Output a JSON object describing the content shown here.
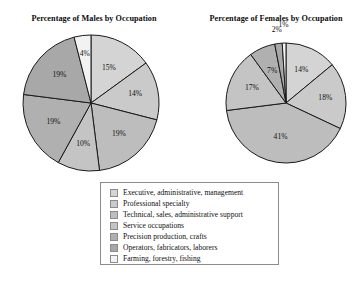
{
  "figure": {
    "background_color": "#ffffff",
    "outline_color": "#1a1a1a"
  },
  "charts": {
    "males": {
      "title": "Percentage of Males by Occupation"
    },
    "females": {
      "title": "Percentage of Females by Occupation"
    }
  },
  "legend": {
    "border_color": "#8c8c8c",
    "items": [
      {
        "label": "Executive, administrative, management",
        "color": "#d4d4d4"
      },
      {
        "label": "Professional specialty",
        "color": "#cacaca"
      },
      {
        "label": "Technical, sales, administrative support",
        "color": "#bdbdbd"
      },
      {
        "label": "Service occupations",
        "color": "#c4c4c4"
      },
      {
        "label": "Precision production, crafts",
        "color": "#b0b0b0"
      },
      {
        "label": "Operators, fabricators, laborers",
        "color": "#a8a8a8"
      },
      {
        "label": "Farming, forestry, fishing",
        "color": "#f2f2f2"
      }
    ]
  },
  "chart_data": [
    {
      "type": "pie",
      "title": "Percentage of Males by Occupation",
      "id": "males",
      "start_angle_deg": 0,
      "direction": "clockwise",
      "center": {
        "x": 73,
        "y": 71
      },
      "radius": 68,
      "labels": [
        "Executive, administrative, management",
        "Professional specialty",
        "Technical, sales, administrative support",
        "Service occupations",
        "Precision production, crafts",
        "Operators, fabricators, laborers",
        "Farming, forestry, fishing"
      ],
      "values": [
        15,
        14,
        19,
        10,
        19,
        19,
        4
      ],
      "value_labels": [
        "15%",
        "14%",
        "19%",
        "10%",
        "19%",
        "19%",
        "4%"
      ],
      "colors": [
        "#d4d4d4",
        "#cacaca",
        "#bdbdbd",
        "#c4c4c4",
        "#b0b0b0",
        "#a8a8a8",
        "#f2f2f2"
      ],
      "label_radius_frac": [
        0.58,
        0.66,
        0.62,
        0.62,
        0.62,
        0.62,
        0.72
      ]
    },
    {
      "type": "pie",
      "title": "Percentage of Females by Occupation",
      "id": "females",
      "start_angle_deg": 0,
      "direction": "clockwise",
      "center": {
        "x": 66,
        "y": 65
      },
      "radius": 60,
      "labels": [
        "Executive, administrative, management",
        "Professional specialty",
        "Technical, sales, administrative support",
        "Service occupations",
        "Precision production, crafts",
        "Operators, fabricators, laborers",
        "Farming, forestry, fishing"
      ],
      "values": [
        14,
        18,
        41,
        17,
        7,
        2,
        1
      ],
      "value_labels": [
        "14%",
        "18%",
        "41%",
        "17%",
        "7%",
        "2%",
        "1%"
      ],
      "colors": [
        "#d4d4d4",
        "#cacaca",
        "#bdbdbd",
        "#c4c4c4",
        "#b0b0b0",
        "#a8a8a8",
        "#f2f2f2"
      ],
      "label_radius_frac": [
        0.6,
        0.66,
        0.58,
        0.62,
        0.58,
        1.22,
        1.3
      ]
    }
  ]
}
